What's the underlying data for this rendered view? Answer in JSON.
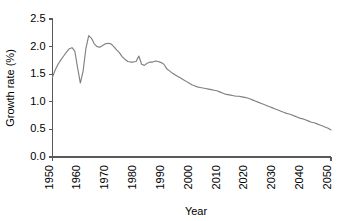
{
  "chart_data": {
    "type": "line",
    "title": "",
    "xlabel": "Year",
    "ylabel": "Growth rate (%)",
    "xlim": [
      1950,
      2050
    ],
    "ylim": [
      0.0,
      2.5
    ],
    "xticks": [
      1950,
      1960,
      1970,
      1980,
      1990,
      2000,
      2010,
      2020,
      2030,
      2040,
      2050
    ],
    "xtick_labels": [
      "1950",
      "1960",
      "1970",
      "1980",
      "1990",
      "2000",
      "2010",
      "2020",
      "2030",
      "2040",
      "2050"
    ],
    "yticks": [
      0.0,
      0.5,
      1.0,
      1.5,
      2.0,
      2.5
    ],
    "ytick_labels": [
      "0.0",
      "0.5",
      "1.0",
      "1.5",
      "2.0",
      "2.5"
    ],
    "grid": false,
    "legend": false,
    "legend_position": "none",
    "line_color": "#808080",
    "series": [
      {
        "name": "World population growth rate",
        "x": [
          1950,
          1951,
          1952,
          1953,
          1954,
          1955,
          1956,
          1957,
          1958,
          1959,
          1960,
          1961,
          1962,
          1963,
          1964,
          1965,
          1966,
          1967,
          1968,
          1969,
          1970,
          1971,
          1972,
          1973,
          1974,
          1975,
          1976,
          1977,
          1978,
          1979,
          1980,
          1981,
          1982,
          1983,
          1984,
          1985,
          1986,
          1987,
          1988,
          1989,
          1990,
          1991,
          1992,
          1993,
          1994,
          1995,
          1996,
          1997,
          1998,
          1999,
          2000,
          2001,
          2002,
          2003,
          2004,
          2005,
          2006,
          2007,
          2008,
          2009,
          2010,
          2011,
          2012,
          2013,
          2014,
          2015,
          2016,
          2017,
          2018,
          2019,
          2020,
          2021,
          2022,
          2023,
          2024,
          2025,
          2026,
          2027,
          2028,
          2029,
          2030,
          2031,
          2032,
          2033,
          2034,
          2035,
          2036,
          2037,
          2038,
          2039,
          2040,
          2041,
          2042,
          2043,
          2044,
          2045,
          2046,
          2047,
          2048,
          2049,
          2050
        ],
        "y": [
          1.45,
          1.58,
          1.68,
          1.76,
          1.83,
          1.9,
          1.96,
          1.98,
          1.92,
          1.62,
          1.34,
          1.56,
          1.97,
          2.2,
          2.15,
          2.05,
          2.0,
          1.99,
          2.02,
          2.05,
          2.06,
          2.05,
          2.0,
          1.94,
          1.89,
          1.82,
          1.77,
          1.73,
          1.72,
          1.72,
          1.73,
          1.83,
          1.68,
          1.66,
          1.7,
          1.72,
          1.72,
          1.74,
          1.73,
          1.71,
          1.68,
          1.6,
          1.56,
          1.52,
          1.49,
          1.46,
          1.43,
          1.4,
          1.37,
          1.34,
          1.31,
          1.29,
          1.27,
          1.26,
          1.25,
          1.24,
          1.23,
          1.22,
          1.21,
          1.2,
          1.18,
          1.16,
          1.14,
          1.13,
          1.12,
          1.11,
          1.1,
          1.1,
          1.09,
          1.08,
          1.07,
          1.05,
          1.03,
          1.01,
          0.99,
          0.97,
          0.95,
          0.93,
          0.91,
          0.89,
          0.87,
          0.85,
          0.83,
          0.81,
          0.79,
          0.78,
          0.76,
          0.74,
          0.72,
          0.7,
          0.69,
          0.67,
          0.65,
          0.63,
          0.62,
          0.6,
          0.58,
          0.56,
          0.54,
          0.52,
          0.49
        ]
      }
    ]
  }
}
